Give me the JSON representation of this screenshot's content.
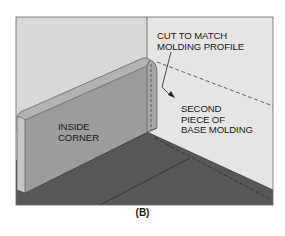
{
  "figure": {
    "caption": "(B)",
    "labels": {
      "cut_note": {
        "line1": "CUT TO MATCH",
        "line2": "MOLDING PROFILE"
      },
      "second_piece": {
        "line1": "SECOND",
        "line2": "PIECE OF",
        "line3": "BASE MOLDING"
      },
      "inside_corner": {
        "line1": "INSIDE",
        "line2": "CORNER"
      }
    },
    "colors": {
      "back_wall_left": "#d9d9d9",
      "back_wall_right": "#e6e6e6",
      "molding_face": "#9a9a9a",
      "molding_top": "#b4b4b4",
      "molding_end": "#c4c4c4",
      "floor": "#555555",
      "outline": "#3a3a3a"
    }
  }
}
